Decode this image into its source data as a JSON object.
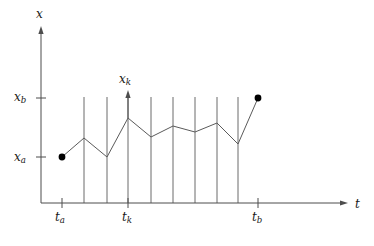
{
  "figure": {
    "background_color": "#ffffff",
    "line_color": "#5a5a5a",
    "axis_color": "#4d4d4d",
    "dot_color": "#000000"
  },
  "axes": {
    "y": {
      "label": "x",
      "label_sub": "",
      "origin_px": [
        41,
        203
      ],
      "tip_px": [
        41,
        26
      ]
    },
    "x": {
      "label": "t",
      "label_sub": "",
      "origin_px": [
        41,
        203
      ],
      "tip_px": [
        348,
        203
      ]
    }
  },
  "y_ticks": [
    {
      "name": "x_b",
      "label": "x",
      "sub": "b",
      "y_px": 98
    },
    {
      "name": "x_a",
      "label": "x",
      "sub": "a",
      "y_px": 157
    }
  ],
  "x_ticks": [
    {
      "name": "t_a",
      "label": "t",
      "sub": "a",
      "x_px": 62
    },
    {
      "name": "t_k",
      "label": "t",
      "sub": "k",
      "x_px": 128
    },
    {
      "name": "t_b",
      "label": "t",
      "sub": "b",
      "x_px": 258
    }
  ],
  "grid_lines_x_px": [
    84,
    107,
    128,
    151,
    173,
    195,
    217,
    238
  ],
  "grid_line_top_px": 97,
  "grid_line_bottom_px": 203,
  "xk_arrow": {
    "label": "x",
    "sub": "k",
    "x_px": 128,
    "tail_y_px": 118,
    "head_y_px": 90
  },
  "endpoints": [
    {
      "name": "start-point",
      "x_px": 62,
      "y_px": 157,
      "radius_px": 3.4
    },
    {
      "name": "end-point",
      "x_px": 258,
      "y_px": 98,
      "radius_px": 3.4
    }
  ],
  "chart_data": {
    "type": "line",
    "title": "",
    "xlabel": "t",
    "ylabel": "x",
    "grid": true,
    "legend": null,
    "xlim_px": [
      41,
      348
    ],
    "ylim_px": [
      203,
      26
    ],
    "x_tick_labels": [
      "t_a",
      "t_k",
      "t_b"
    ],
    "y_tick_labels": [
      "x_a",
      "x_b"
    ],
    "series": [
      {
        "name": "path",
        "points_px": [
          [
            62,
            157
          ],
          [
            84,
            138
          ],
          [
            107,
            157
          ],
          [
            128,
            118
          ],
          [
            151,
            137
          ],
          [
            173,
            126
          ],
          [
            195,
            132
          ],
          [
            217,
            123
          ],
          [
            238,
            144
          ],
          [
            258,
            98
          ]
        ]
      }
    ]
  }
}
